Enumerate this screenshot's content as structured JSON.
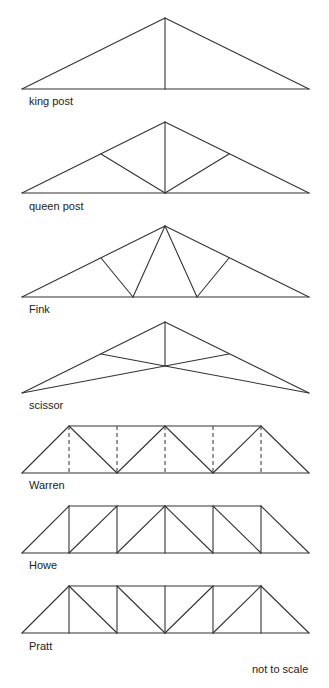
{
  "labels": {
    "king_post": "king post",
    "queen_post": "queen post",
    "fink": "Fink",
    "scissor": "scissor",
    "warren": "Warren",
    "howe": "Howe",
    "pratt": "Pratt",
    "note": "not to scale"
  },
  "colors": {
    "line": "#333333",
    "text": "#222222",
    "background": "#ffffff"
  },
  "trusses": [
    {
      "name": "king post",
      "type": "triangular",
      "members": "two rafters, tie beam, central vertical post"
    },
    {
      "name": "queen post",
      "type": "triangular",
      "members": "two rafters, tie beam, central post, two diagonals to base center"
    },
    {
      "name": "Fink",
      "type": "triangular",
      "members": "two rafters, tie beam, W-shaped web"
    },
    {
      "name": "scissor",
      "type": "triangular",
      "members": "two rafters, raised crossing bottom chords, central post"
    },
    {
      "name": "Warren",
      "type": "parallel-chord",
      "members": "alternating diagonals, dashed optional verticals"
    },
    {
      "name": "Howe",
      "type": "parallel-chord",
      "members": "verticals, diagonals sloping toward center top"
    },
    {
      "name": "Pratt",
      "type": "parallel-chord",
      "members": "verticals, diagonals sloping toward center bottom"
    }
  ]
}
